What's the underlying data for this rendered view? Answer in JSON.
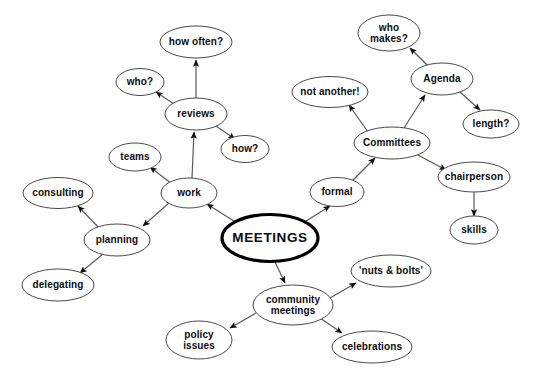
{
  "diagram": {
    "title": "MEETINGS",
    "type": "mind-map",
    "canvas": {
      "width": 534,
      "height": 382,
      "background": "#fefefe"
    },
    "style": {
      "node_fill": "#ffffff",
      "node_stroke": "#4a4a4a",
      "central_stroke": "#000000",
      "link_stroke": "#5a5a5a",
      "text_color": "#0d0d0d"
    }
  },
  "nodes": [
    {
      "id": "meetings",
      "label": "MEETINGS",
      "cx": 270,
      "cy": 238,
      "rx": 48,
      "ry": 23.5,
      "central": true,
      "lines": [
        "MEETINGS"
      ]
    },
    {
      "id": "work",
      "label": "work",
      "cx": 189,
      "cy": 193,
      "rx": 28,
      "ry": 15,
      "central": false,
      "lines": [
        "work"
      ]
    },
    {
      "id": "reviews",
      "label": "reviews",
      "cx": 196,
      "cy": 114,
      "rx": 31,
      "ry": 16,
      "central": false,
      "lines": [
        "reviews"
      ]
    },
    {
      "id": "how-often",
      "label": "how often?",
      "cx": 196,
      "cy": 42,
      "rx": 36,
      "ry": 16,
      "central": false,
      "lines": [
        "how often?"
      ]
    },
    {
      "id": "who",
      "label": "who?",
      "cx": 140,
      "cy": 82,
      "rx": 24,
      "ry": 13.5,
      "central": false,
      "lines": [
        "who?"
      ]
    },
    {
      "id": "how",
      "label": "how?",
      "cx": 245,
      "cy": 149,
      "rx": 24,
      "ry": 13.5,
      "central": false,
      "lines": [
        "how?"
      ]
    },
    {
      "id": "teams",
      "label": "teams",
      "cx": 135,
      "cy": 157,
      "rx": 26,
      "ry": 14,
      "central": false,
      "lines": [
        "teams"
      ]
    },
    {
      "id": "planning",
      "label": "planning",
      "cx": 117,
      "cy": 240,
      "rx": 33,
      "ry": 16,
      "central": false,
      "lines": [
        "planning"
      ]
    },
    {
      "id": "consulting",
      "label": "consulting",
      "cx": 58,
      "cy": 193,
      "rx": 35,
      "ry": 15.5,
      "central": false,
      "lines": [
        "consulting"
      ]
    },
    {
      "id": "delegating",
      "label": "delegating",
      "cx": 58,
      "cy": 285,
      "rx": 36,
      "ry": 16,
      "central": false,
      "lines": [
        "delegating"
      ]
    },
    {
      "id": "formal",
      "label": "formal",
      "cx": 337,
      "cy": 192,
      "rx": 27,
      "ry": 14.5,
      "central": false,
      "lines": [
        "formal"
      ]
    },
    {
      "id": "committees",
      "label": "Committees",
      "cx": 392,
      "cy": 143,
      "rx": 38,
      "ry": 16,
      "central": false,
      "lines": [
        "Committees"
      ]
    },
    {
      "id": "not-another",
      "label": "not another!",
      "cx": 330,
      "cy": 92,
      "rx": 38,
      "ry": 15.5,
      "central": false,
      "lines": [
        "not another!"
      ]
    },
    {
      "id": "agenda",
      "label": "Agenda",
      "cx": 442,
      "cy": 79,
      "rx": 31,
      "ry": 16,
      "central": false,
      "lines": [
        "Agenda"
      ]
    },
    {
      "id": "who-makes",
      "label": "who makes?",
      "cx": 389,
      "cy": 33,
      "rx": 31,
      "ry": 18,
      "central": false,
      "lines": [
        "who",
        "makes?"
      ]
    },
    {
      "id": "length",
      "label": "length?",
      "cx": 491,
      "cy": 124,
      "rx": 28,
      "ry": 14,
      "central": false,
      "lines": [
        "length?"
      ]
    },
    {
      "id": "chairperson",
      "label": "chairperson",
      "cx": 474,
      "cy": 177,
      "rx": 36,
      "ry": 15,
      "central": false,
      "lines": [
        "chairperson"
      ]
    },
    {
      "id": "skills",
      "label": "skills",
      "cx": 474,
      "cy": 230,
      "rx": 24,
      "ry": 14,
      "central": false,
      "lines": [
        "skills"
      ]
    },
    {
      "id": "community",
      "label": "community meetings",
      "cx": 293,
      "cy": 305,
      "rx": 40,
      "ry": 20,
      "central": false,
      "lines": [
        "community",
        "meetings"
      ]
    },
    {
      "id": "nuts-bolts",
      "label": "'nuts & bolts'",
      "cx": 391,
      "cy": 271,
      "rx": 40,
      "ry": 16,
      "central": false,
      "lines": [
        "'nuts & bolts'"
      ]
    },
    {
      "id": "celebrations",
      "label": "celebrations",
      "cx": 372,
      "cy": 347,
      "rx": 40,
      "ry": 16,
      "central": false,
      "lines": [
        "celebrations"
      ]
    },
    {
      "id": "policy",
      "label": "policy issues",
      "cx": 199,
      "cy": 340,
      "rx": 33,
      "ry": 19,
      "central": false,
      "lines": [
        "policy",
        "issues"
      ]
    }
  ],
  "links": [
    {
      "from": "meetings",
      "to": "work",
      "x1": 237,
      "y1": 223,
      "x2": 207,
      "y2": 204
    },
    {
      "from": "meetings",
      "to": "formal",
      "x1": 303,
      "y1": 223,
      "x2": 330,
      "y2": 206
    },
    {
      "from": "meetings",
      "to": "community",
      "x1": 275,
      "y1": 262,
      "x2": 285,
      "y2": 283
    },
    {
      "from": "work",
      "to": "reviews",
      "x1": 192,
      "y1": 178,
      "x2": 194,
      "y2": 132
    },
    {
      "from": "work",
      "to": "teams",
      "x1": 172,
      "y1": 184,
      "x2": 150,
      "y2": 167
    },
    {
      "from": "work",
      "to": "planning",
      "x1": 170,
      "y1": 202,
      "x2": 143,
      "y2": 226
    },
    {
      "from": "reviews",
      "to": "how-often",
      "x1": 196,
      "y1": 98,
      "x2": 196,
      "y2": 60
    },
    {
      "from": "reviews",
      "to": "who",
      "x1": 174,
      "y1": 104,
      "x2": 156,
      "y2": 92
    },
    {
      "from": "reviews",
      "to": "how",
      "x1": 216,
      "y1": 126,
      "x2": 235,
      "y2": 139
    },
    {
      "from": "planning",
      "to": "consulting",
      "x1": 99,
      "y1": 228,
      "x2": 78,
      "y2": 206
    },
    {
      "from": "planning",
      "to": "delegating",
      "x1": 103,
      "y1": 254,
      "x2": 80,
      "y2": 273
    },
    {
      "from": "formal",
      "to": "committees",
      "x1": 352,
      "y1": 181,
      "x2": 375,
      "y2": 158
    },
    {
      "from": "committees",
      "to": "not-another",
      "x1": 368,
      "y1": 132,
      "x2": 349,
      "y2": 105
    },
    {
      "from": "committees",
      "to": "agenda",
      "x1": 404,
      "y1": 128,
      "x2": 425,
      "y2": 95
    },
    {
      "from": "committees",
      "to": "chairperson",
      "x1": 416,
      "y1": 154,
      "x2": 446,
      "y2": 170
    },
    {
      "from": "agenda",
      "to": "who-makes",
      "x1": 428,
      "y1": 66,
      "x2": 410,
      "y2": 48
    },
    {
      "from": "agenda",
      "to": "length",
      "x1": 460,
      "y1": 92,
      "x2": 480,
      "y2": 110
    },
    {
      "from": "chairperson",
      "to": "skills",
      "x1": 474,
      "y1": 192,
      "x2": 474,
      "y2": 216
    },
    {
      "from": "community",
      "to": "nuts-bolts",
      "x1": 330,
      "y1": 298,
      "x2": 356,
      "y2": 283
    },
    {
      "from": "community",
      "to": "celebrations",
      "x1": 320,
      "y1": 318,
      "x2": 342,
      "y2": 333
    },
    {
      "from": "community",
      "to": "policy",
      "x1": 256,
      "y1": 313,
      "x2": 230,
      "y2": 328
    }
  ]
}
